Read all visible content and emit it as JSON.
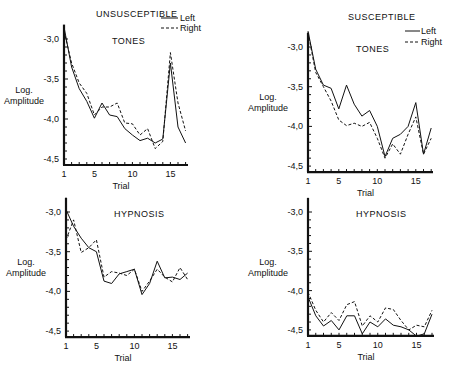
{
  "figure": {
    "groups": [
      {
        "label": "UNSUSCEPTIBLE"
      },
      {
        "label": "SUSCEPTIBLE"
      }
    ],
    "legend": [
      {
        "label": "Left",
        "style": "solid"
      },
      {
        "label": "Right",
        "style": "dashed"
      }
    ]
  },
  "chart_data": [
    {
      "type": "line",
      "group": "UNSUSCEPTIBLE",
      "title": "TONES",
      "xlabel": "Trial",
      "ylabel": "Log. Amplitude",
      "xticks": [
        1,
        5,
        10,
        15
      ],
      "yticks": [
        "-3.0",
        "-3.5",
        "-4.0",
        "-4.5"
      ],
      "ylim": [
        -4.55,
        -2.85
      ],
      "x": [
        1,
        2,
        3,
        4,
        5,
        6,
        7,
        8,
        9,
        10,
        11,
        12,
        13,
        14,
        15,
        16,
        17
      ],
      "series": [
        {
          "name": "Left",
          "values": [
            -2.85,
            -3.35,
            -3.62,
            -3.78,
            -3.99,
            -3.8,
            -3.95,
            -3.97,
            -4.12,
            -4.2,
            -4.27,
            -4.24,
            -4.3,
            -4.25,
            -3.3,
            -4.1,
            -4.3
          ]
        },
        {
          "name": "Right",
          "values": [
            -2.9,
            -3.3,
            -3.55,
            -3.68,
            -3.95,
            -3.85,
            -3.85,
            -3.8,
            -4.05,
            -4.06,
            -4.2,
            -4.12,
            -4.37,
            -4.28,
            -3.17,
            -3.8,
            -4.15
          ]
        }
      ],
      "legend_position": "top-right"
    },
    {
      "type": "line",
      "group": "SUSCEPTIBLE",
      "title": "TONES",
      "xlabel": "Trial",
      "ylabel": "Log. Amplitude",
      "xticks": [
        1,
        5,
        10,
        15
      ],
      "yticks": [
        "-3.0",
        "-3.5",
        "-4.0",
        "-4.5"
      ],
      "ylim": [
        -4.55,
        -2.8
      ],
      "x": [
        1,
        2,
        3,
        4,
        5,
        6,
        7,
        8,
        9,
        10,
        11,
        12,
        13,
        14,
        15,
        16,
        17
      ],
      "series": [
        {
          "name": "Left",
          "values": [
            -2.8,
            -3.28,
            -3.48,
            -3.52,
            -3.78,
            -3.48,
            -3.72,
            -3.87,
            -3.8,
            -4.0,
            -4.38,
            -4.15,
            -4.1,
            -4.0,
            -3.7,
            -4.35,
            -4.02
          ]
        },
        {
          "name": "Right",
          "values": [
            -2.82,
            -3.32,
            -3.5,
            -3.68,
            -3.92,
            -3.99,
            -3.96,
            -4.0,
            -3.95,
            -4.15,
            -4.4,
            -4.22,
            -4.35,
            -4.1,
            -3.88,
            -4.35,
            -4.15
          ]
        }
      ],
      "legend_position": "top-right"
    },
    {
      "type": "line",
      "group": "UNSUSCEPTIBLE",
      "title": "HYPNOSIS",
      "xlabel": "Trial",
      "ylabel": "Log. Amplitude",
      "xticks": [
        1,
        5,
        10,
        15
      ],
      "yticks": [
        "-3.0",
        "-3.5",
        "-4.0",
        "-4.5"
      ],
      "ylim": [
        -4.6,
        -2.95
      ],
      "x": [
        1,
        2,
        3,
        4,
        5,
        6,
        7,
        8,
        9,
        10,
        11,
        12,
        13,
        14,
        15,
        16,
        17
      ],
      "series": [
        {
          "name": "Left",
          "values": [
            -2.97,
            -3.18,
            -3.33,
            -3.45,
            -3.5,
            -3.87,
            -3.9,
            -3.78,
            -3.75,
            -3.72,
            -4.04,
            -3.9,
            -3.62,
            -3.83,
            -3.82,
            -3.85,
            -3.77
          ]
        },
        {
          "name": "Right",
          "values": [
            -3.35,
            -3.1,
            -3.51,
            -3.45,
            -3.35,
            -3.82,
            -3.75,
            -3.77,
            -3.8,
            -3.72,
            -4.0,
            -3.87,
            -3.72,
            -3.82,
            -3.88,
            -3.7,
            -3.85
          ]
        }
      ]
    },
    {
      "type": "line",
      "group": "SUSCEPTIBLE",
      "title": "HYPNOSIS",
      "xlabel": "Trial",
      "ylabel": "Log. Amplitude",
      "xticks": [
        1,
        5,
        10,
        15
      ],
      "yticks": [
        "-3.0",
        "-3.5",
        "-4.0",
        "-4.5"
      ],
      "ylim": [
        -4.6,
        -2.95
      ],
      "x": [
        1,
        2,
        3,
        4,
        5,
        6,
        7,
        8,
        9,
        10,
        11,
        12,
        13,
        14,
        15,
        16,
        17
      ],
      "series": [
        {
          "name": "Left",
          "values": [
            -4.08,
            -4.32,
            -4.45,
            -4.38,
            -4.5,
            -4.32,
            -4.32,
            -4.55,
            -4.4,
            -4.46,
            -4.36,
            -4.44,
            -4.46,
            -4.5,
            -4.58,
            -4.55,
            -4.3
          ]
        },
        {
          "name": "Right",
          "values": [
            -4.02,
            -4.25,
            -4.4,
            -4.28,
            -4.38,
            -4.18,
            -4.14,
            -4.45,
            -4.32,
            -4.4,
            -4.22,
            -4.24,
            -4.38,
            -4.5,
            -4.44,
            -4.46,
            -4.25
          ]
        }
      ]
    }
  ],
  "layout": {
    "panels": [
      {
        "x0": 64,
        "xStep": 7.6,
        "y30": 39,
        "yPerHalf": 40,
        "xmax": 188
      },
      {
        "x0": 308,
        "xStep": 7.7,
        "y30": 47,
        "yPerHalf": 39.7,
        "xmax": 433
      },
      {
        "x0": 66,
        "xStep": 7.6,
        "y30": 212,
        "yPerHalf": 39.7,
        "xmax": 190
      },
      {
        "x0": 308,
        "xStep": 7.75,
        "y30": 212,
        "yPerHalf": 39.3,
        "xmax": 434
      }
    ]
  }
}
